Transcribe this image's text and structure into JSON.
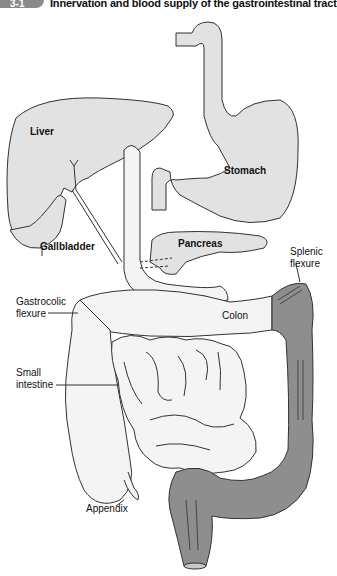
{
  "figure": {
    "badge": "3-1",
    "title": "Innervation and blood supply of the gastrointestinal tract"
  },
  "labels": {
    "liver": "Liver",
    "stomach": "Stomach",
    "gallbladder": "Gallbladder",
    "pancreas": "Pancreas",
    "splenic_flexure_1": "Splenic",
    "splenic_flexure_2": "flexure",
    "gastrocolic_flexure_1": "Gastrocolic",
    "gastrocolic_flexure_2": "flexure",
    "colon": "Colon",
    "small_intestine_1": "Small",
    "small_intestine_2": "intestine",
    "appendix": "Appendix"
  },
  "colors": {
    "organ_fill": "#e2e2e2",
    "intestine_fill": "#f4f4f4",
    "descending_colon_fill": "#8e8e8e",
    "outline": "#333333"
  }
}
